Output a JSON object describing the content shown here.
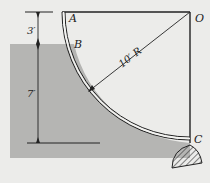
{
  "figure": {
    "type": "curved-gate-diagram",
    "colors": {
      "background": "#ececea",
      "water": "#b5b5b3",
      "line": "#222222",
      "gate_fill": "#f2f2f0"
    },
    "points": {
      "A": "A",
      "B": "B",
      "O": "O",
      "C": "C"
    },
    "dimensions": {
      "top_depth": "3′",
      "submerged_depth": "7′",
      "radius": "10′ R"
    }
  }
}
